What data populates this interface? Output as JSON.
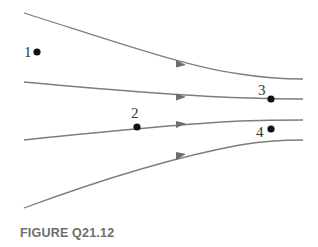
{
  "figure": {
    "caption": "FIGURE Q21.12",
    "colors": {
      "streamline": "#7d7d7d",
      "point": "#111111",
      "caption": "#6d6d6d"
    },
    "streamlines": [
      {
        "id": 1,
        "start": [
          24,
          13
        ],
        "end": [
          303,
          79
        ],
        "arrow_at": [
          181,
          64
        ],
        "direction": "right"
      },
      {
        "id": 2,
        "start": [
          24,
          82
        ],
        "end": [
          303,
          99
        ],
        "arrow_at": [
          181,
          97
        ],
        "direction": "right"
      },
      {
        "id": 3,
        "start": [
          24,
          140
        ],
        "end": [
          303,
          120
        ],
        "arrow_at": [
          181,
          124
        ],
        "direction": "right"
      },
      {
        "id": 4,
        "start": [
          24,
          208
        ],
        "end": [
          303,
          140
        ],
        "arrow_at": [
          181,
          156
        ],
        "direction": "right"
      }
    ],
    "points": [
      {
        "label": "1",
        "x": 37,
        "y": 52
      },
      {
        "label": "2",
        "x": 137,
        "y": 127
      },
      {
        "label": "3",
        "x": 271,
        "y": 99
      },
      {
        "label": "4",
        "x": 271,
        "y": 129
      }
    ]
  }
}
